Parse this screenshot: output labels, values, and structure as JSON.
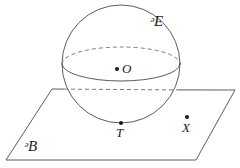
{
  "figure": {
    "background_color": "#ffffff",
    "stroke_color": "#4a4a4a",
    "dashed_stroke_color": "#6d6d6d",
    "dot_color": "#1a1a1a",
    "width": 240,
    "height": 168
  },
  "labels": {
    "sphere": "ᵊE",
    "center": "O",
    "tangent_point": "T",
    "plane_point": "X",
    "plane": "ᵊB"
  },
  "points": [
    {
      "name": "center",
      "label": "O",
      "x": 117,
      "y": 69,
      "radius": 2.0
    },
    {
      "name": "tangent-point",
      "label": "T",
      "x": 121,
      "y": 123,
      "radius": 2.0
    },
    {
      "name": "plane-point",
      "label": "X",
      "x": 187,
      "y": 117,
      "radius": 2.0
    }
  ],
  "sphere": {
    "center_x": 121,
    "center_y": 64,
    "radius": 59
  },
  "equator": {
    "center_x": 121,
    "center_y": 64,
    "rx": 59,
    "ry": 17,
    "front_style": "solid",
    "back_style": "dashed"
  },
  "plane": {
    "shape": "parallelogram",
    "corners": [
      {
        "name": "top-left",
        "x": 52,
        "y": 89
      },
      {
        "name": "top-right",
        "x": 235,
        "y": 90
      },
      {
        "name": "bottom-right",
        "x": 196,
        "y": 160
      },
      {
        "name": "bottom-left",
        "x": 6,
        "y": 160
      }
    ],
    "hidden_edge_style": "dashed"
  }
}
